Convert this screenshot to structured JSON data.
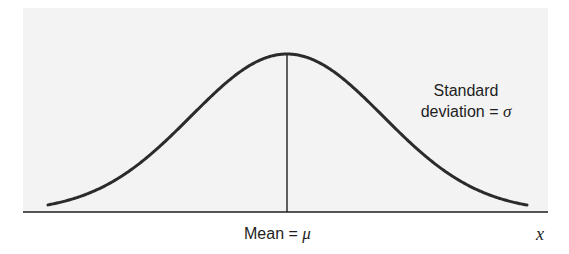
{
  "chart_data": {
    "type": "line",
    "title": "",
    "xlabel": "x",
    "ylabel": "",
    "mean_label": "Mean = ",
    "mean_symbol": "μ",
    "sd_label_line1": "Standard",
    "sd_label_line2": "deviation = ",
    "sd_symbol": "σ",
    "grid": false,
    "legend": "none",
    "series": [
      {
        "name": "normal density",
        "distribution": "normal",
        "mean": "μ",
        "std": "σ"
      }
    ],
    "layout": {
      "plot_left": 23,
      "plot_top": 8,
      "plot_right": 548,
      "axis_y": 212,
      "center_x": 287,
      "peak_y": 54,
      "sigma_px": 96,
      "curve_start_x": 48,
      "curve_end_x": 527
    }
  },
  "colors": {
    "background": "#ffffff",
    "plot_background": "#f3f3f3",
    "curve": "#2b2b2b",
    "axis": "#1e1e1e",
    "text": "#1e1e1e"
  }
}
